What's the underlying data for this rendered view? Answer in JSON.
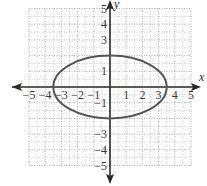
{
  "chart_data": {
    "type": "line",
    "title": "",
    "xlabel": "x",
    "ylabel": "y",
    "xlim": [
      -5,
      5
    ],
    "ylim": [
      -5,
      5
    ],
    "grid": true,
    "grid_style": "dotted",
    "x_ticks": [
      -5,
      -4,
      -3,
      -2,
      -1,
      1,
      2,
      3,
      4,
      5
    ],
    "y_ticks": [
      -5,
      -4,
      -3,
      -1,
      1,
      3,
      4,
      5
    ],
    "series": [
      {
        "name": "ellipse",
        "shape": "ellipse",
        "center": [
          0,
          0
        ],
        "semi_axis_x": 3.5,
        "semi_axis_y": 2,
        "equation": "x^2/12.25 + y^2/4 = 1",
        "vertices": [
          [
            -3.5,
            0
          ],
          [
            3.5,
            0
          ],
          [
            0,
            2
          ],
          [
            0,
            -2
          ]
        ]
      }
    ]
  },
  "labels": {
    "x_axis": "x",
    "y_axis": "y",
    "x_ticks": [
      "−5",
      "−4",
      "−3",
      "−2",
      "−1",
      "1",
      "2",
      "3",
      "4",
      "5"
    ],
    "y_ticks_pos": [
      "1",
      "3",
      "4",
      "5"
    ],
    "y_ticks_neg": [
      "−1",
      "−3",
      "−4",
      "−5"
    ]
  },
  "colors": {
    "axis": "#2a2a2a",
    "grid": "#9a9a9a",
    "curve": "#555555"
  }
}
